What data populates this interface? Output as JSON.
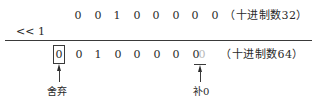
{
  "diagram": {
    "row_original": {
      "bits": [
        "0",
        "0",
        "1",
        "0",
        "0",
        "0",
        "0",
        "0"
      ],
      "label": "（十进制数32）"
    },
    "operator": "<<  1",
    "row_result": {
      "discarded_bit": "0",
      "bits": [
        "0",
        "1",
        "0",
        "0",
        "0",
        "0",
        "0"
      ],
      "padded_bit": "0",
      "label": "（十进制数64）"
    },
    "annotations": {
      "discard": "舍弃",
      "pad_zero": "补0"
    },
    "colors": {
      "ink": "#2a2a2a",
      "faint_digit": "#b8b8b8",
      "background": "#ffffff"
    }
  }
}
